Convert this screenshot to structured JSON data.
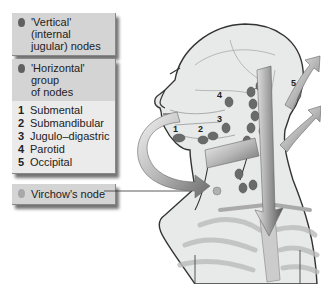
{
  "legend": {
    "vertical": {
      "label": "'Vertical' (internal jugular) nodes",
      "line1": "'Vertical' (internal",
      "line2": "jugular) nodes",
      "dot_color": "#606060"
    },
    "horizontal": {
      "line1": "'Horizontal' group",
      "line2": "of nodes",
      "dot_color": "#606060",
      "items": [
        {
          "num": "1",
          "label": "Submental"
        },
        {
          "num": "2",
          "label": "Submandibular"
        },
        {
          "num": "3",
          "label": "Jugulo–digastric"
        },
        {
          "num": "4",
          "label": "Parotid"
        },
        {
          "num": "5",
          "label": "Occipital"
        }
      ]
    },
    "virchow": {
      "label": "Virchow's node",
      "dot_color": "#a8a8a8"
    }
  },
  "diagram": {
    "node_labels": [
      "1",
      "2",
      "3",
      "4",
      "5"
    ]
  }
}
